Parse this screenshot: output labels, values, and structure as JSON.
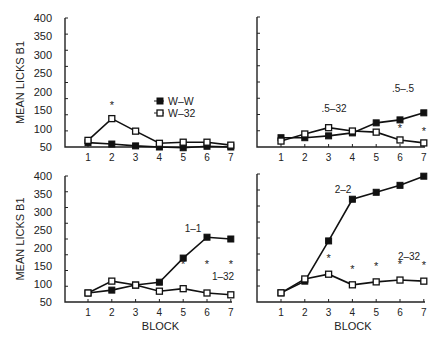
{
  "figure": {
    "ylabel": "MEAN LICKS B1",
    "xlabel": "BLOCK",
    "yticks": [
      "400",
      "350",
      "300",
      "250",
      "200",
      "150",
      "100",
      "50"
    ],
    "xticks": [
      "1",
      "2",
      "3",
      "4",
      "5",
      "6",
      "7"
    ],
    "legend": {
      "filled": "W–W",
      "open": "W–32"
    }
  },
  "chart_data": [
    {
      "type": "line",
      "panel": "top-left",
      "title": "",
      "xlabel": "",
      "ylabel": "MEAN LICKS B1",
      "x": [
        1,
        2,
        3,
        4,
        5,
        6,
        7
      ],
      "ylim": [
        50,
        400
      ],
      "series": [
        {
          "name": "W–W",
          "marker": "filled-square",
          "values": [
            62,
            58,
            53,
            50,
            48,
            52,
            50
          ]
        },
        {
          "name": "W–32",
          "marker": "open-square",
          "values": [
            68,
            127,
            93,
            60,
            63,
            63,
            55
          ]
        }
      ],
      "annotations": [
        {
          "text": "*",
          "x": 2,
          "series": "W–32"
        }
      ],
      "legend": {
        "entries": [
          "W–W",
          "W–32"
        ],
        "position": "center-right"
      }
    },
    {
      "type": "line",
      "panel": "top-right",
      "x": [
        1,
        2,
        3,
        4,
        5,
        6,
        7
      ],
      "ylim": [
        50,
        400
      ],
      "series": [
        {
          "name": ".5–.5",
          "marker": "filled-square",
          "values": [
            75,
            75,
            80,
            88,
            115,
            123,
            142
          ]
        },
        {
          "name": ".5–32",
          "marker": "open-square",
          "values": [
            66,
            85,
            102,
            93,
            90,
            69,
            61
          ]
        }
      ],
      "labels": [
        {
          "text": ".5–32",
          "near_x": 3
        },
        {
          "text": ".5–.5",
          "near_x": 6
        }
      ],
      "annotations": [
        {
          "text": "*",
          "x": 6
        },
        {
          "text": "*",
          "x": 7
        }
      ]
    },
    {
      "type": "line",
      "panel": "bottom-left",
      "xlabel": "BLOCK",
      "ylabel": "MEAN LICKS B1",
      "x": [
        1,
        2,
        3,
        4,
        5,
        6,
        7
      ],
      "ylim": [
        50,
        400
      ],
      "series": [
        {
          "name": "1–1",
          "marker": "filled-square",
          "values": [
            75,
            83,
            97,
            105,
            172,
            230,
            225
          ]
        },
        {
          "name": "1–32",
          "marker": "open-square",
          "values": [
            75,
            108,
            97,
            80,
            87,
            75,
            70
          ]
        }
      ],
      "labels": [
        {
          "text": "1–1",
          "near_x": 5.5
        },
        {
          "text": "1–32",
          "near_x": 6
        }
      ],
      "annotations": [
        {
          "text": "*",
          "x": 5
        },
        {
          "text": "*",
          "x": 6
        },
        {
          "text": "*",
          "x": 7
        }
      ]
    },
    {
      "type": "line",
      "panel": "bottom-right",
      "xlabel": "BLOCK",
      "x": [
        1,
        2,
        3,
        4,
        5,
        6,
        7
      ],
      "ylim": [
        50,
        400
      ],
      "series": [
        {
          "name": "2–2",
          "marker": "filled-square",
          "values": [
            75,
            107,
            217,
            331,
            350,
            369,
            394
          ]
        },
        {
          "name": "2–32",
          "marker": "open-square",
          "values": [
            75,
            113,
            126,
            97,
            105,
            110,
            107
          ]
        }
      ],
      "labels": [
        {
          "text": "2–2",
          "near_x": 3.5
        },
        {
          "text": "2–32",
          "near_x": 6
        }
      ],
      "annotations": [
        {
          "text": "*",
          "x": 3
        },
        {
          "text": "*",
          "x": 4
        },
        {
          "text": "*",
          "x": 5
        },
        {
          "text": "*",
          "x": 6
        },
        {
          "text": "*",
          "x": 7
        }
      ]
    }
  ]
}
